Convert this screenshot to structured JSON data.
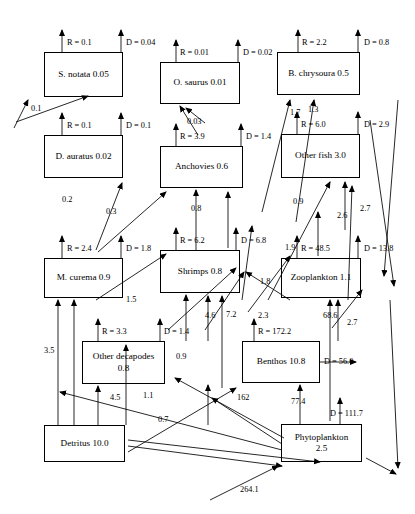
{
  "figure": {
    "type": "ecological-flow-network-diagram",
    "width": 415,
    "height": 514,
    "background": "#ffffff",
    "line_color": "#000000"
  },
  "nodes": [
    {
      "id": "s_notata",
      "label": "S. notata 0.05",
      "biomass": 0.05,
      "respiration": 0.1,
      "detritus_export": 0.04,
      "x": 44,
      "y": 52,
      "w": 79,
      "h": 45
    },
    {
      "id": "o_saurus",
      "label": "O. saurus 0.01",
      "biomass": 0.01,
      "respiration": 0.01,
      "detritus_export": 0.02,
      "x": 160,
      "y": 62,
      "w": 80,
      "h": 42
    },
    {
      "id": "b_chrysoura",
      "label": "B. chrysoura 0.5",
      "biomass": 0.5,
      "respiration": 2.2,
      "detritus_export": 0.8,
      "x": 277,
      "y": 52,
      "w": 83,
      "h": 43
    },
    {
      "id": "d_auratus",
      "label": "D. auratus 0.02",
      "biomass": 0.02,
      "respiration": 0.1,
      "detritus_export": 0.1,
      "x": 44,
      "y": 135,
      "w": 79,
      "h": 43
    },
    {
      "id": "anchovies",
      "label": "Anchovies 0.6",
      "biomass": 0.6,
      "respiration": 3.9,
      "detritus_export": 1.4,
      "x": 160,
      "y": 146,
      "w": 83,
      "h": 42
    },
    {
      "id": "other_fish",
      "label": "Other fish 3.0",
      "biomass": 3.0,
      "respiration": 6.0,
      "detritus_export": 2.9,
      "x": 281,
      "y": 134,
      "w": 79,
      "h": 44
    },
    {
      "id": "m_curema",
      "label": "M. curema 0.9",
      "biomass": 0.9,
      "respiration": 2.4,
      "detritus_export": 1.8,
      "x": 44,
      "y": 258,
      "w": 79,
      "h": 40
    },
    {
      "id": "shrimps",
      "label": "Shrimps 0.8",
      "biomass": 0.8,
      "respiration": 6.2,
      "detritus_export": 6.8,
      "x": 160,
      "y": 250,
      "w": 80,
      "h": 43
    },
    {
      "id": "zooplankton",
      "label": "Zooplankton 1.1",
      "biomass": 1.1,
      "respiration": 48.5,
      "detritus_export": 13.8,
      "x": 281,
      "y": 258,
      "w": 80,
      "h": 40
    },
    {
      "id": "other_decapodes",
      "label": "Other decapodes\n0.8",
      "biomass": 0.8,
      "respiration": 3.3,
      "detritus_export": 1.4,
      "x": 82,
      "y": 341,
      "w": 83,
      "h": 43
    },
    {
      "id": "benthos",
      "label": "Benthos 10.8",
      "biomass": 10.8,
      "respiration": 172.2,
      "detritus_export": 56.0,
      "x": 242,
      "y": 341,
      "w": 78,
      "h": 42
    },
    {
      "id": "detritus",
      "label": "Detritus 10.0",
      "biomass": 10.0,
      "respiration": null,
      "detritus_export": null,
      "x": 44,
      "y": 425,
      "w": 81,
      "h": 37
    },
    {
      "id": "phytoplankton",
      "label": "Phytoplankton\n2.5",
      "biomass": 2.5,
      "respiration": null,
      "detritus_export": 111.7,
      "x": 281,
      "y": 424,
      "w": 81,
      "h": 38
    }
  ],
  "respiration_labels": [
    {
      "node": "s_notata",
      "text": "R = 0.1",
      "x": 67,
      "y": 38
    },
    {
      "node": "o_saurus",
      "text": "R = 0.01",
      "x": 180,
      "y": 48
    },
    {
      "node": "b_chrysoura",
      "text": "R = 2.2",
      "x": 302,
      "y": 38
    },
    {
      "node": "d_auratus",
      "text": "R = 0.1",
      "x": 67,
      "y": 121
    },
    {
      "node": "anchovies",
      "text": "R = 3.9",
      "x": 180,
      "y": 132
    },
    {
      "node": "other_fish",
      "text": "R = 6.0",
      "x": 301,
      "y": 120
    },
    {
      "node": "m_curema",
      "text": "R = 2.4",
      "x": 67,
      "y": 244
    },
    {
      "node": "shrimps",
      "text": "R = 6.2",
      "x": 180,
      "y": 236
    },
    {
      "node": "zooplankton",
      "text": "R = 48.5",
      "x": 301,
      "y": 244
    },
    {
      "node": "other_decapodes",
      "text": "R = 3.3",
      "x": 102,
      "y": 327
    },
    {
      "node": "benthos",
      "text": "R = 172.2",
      "x": 258,
      "y": 327
    }
  ],
  "detritus_export_labels": [
    {
      "node": "s_notata",
      "text": "D = 0.04",
      "x": 126,
      "y": 38
    },
    {
      "node": "o_saurus",
      "text": "D = 0.02",
      "x": 243,
      "y": 48
    },
    {
      "node": "b_chrysoura",
      "text": "D = 0.8",
      "x": 364,
      "y": 38
    },
    {
      "node": "d_auratus",
      "text": "D = 0.1",
      "x": 126,
      "y": 121
    },
    {
      "node": "anchovies",
      "text": "D = 1.4",
      "x": 246,
      "y": 132
    },
    {
      "node": "other_fish",
      "text": "D = 2.9",
      "x": 364,
      "y": 120
    },
    {
      "node": "m_curema",
      "text": "D = 1.8",
      "x": 126,
      "y": 244
    },
    {
      "node": "shrimps",
      "text": "D = 6.8",
      "x": 241,
      "y": 236
    },
    {
      "node": "zooplankton",
      "text": "D = 13.8",
      "x": 364,
      "y": 244
    },
    {
      "node": "other_decapodes",
      "text": "D = 1.4",
      "x": 164,
      "y": 327
    },
    {
      "node": "benthos",
      "text": "D = 56.0",
      "x": 324,
      "y": 357
    },
    {
      "node": "phytoplankton",
      "text": "D = 111.7",
      "x": 330,
      "y": 409
    }
  ],
  "flow_labels": [
    {
      "value": "0.1",
      "x": 31,
      "y": 104
    },
    {
      "value": "0.03",
      "x": 187,
      "y": 117
    },
    {
      "value": "1.7",
      "x": 290,
      "y": 108
    },
    {
      "value": "1.3",
      "x": 308,
      "y": 105
    },
    {
      "value": "0.2",
      "x": 62,
      "y": 195
    },
    {
      "value": "0.3",
      "x": 106,
      "y": 207
    },
    {
      "value": "0.8",
      "x": 191,
      "y": 204
    },
    {
      "value": "0.9",
      "x": 293,
      "y": 197
    },
    {
      "value": "2.6",
      "x": 337,
      "y": 211
    },
    {
      "value": "2.7",
      "x": 360,
      "y": 204
    },
    {
      "value": "1.9",
      "x": 285,
      "y": 243
    },
    {
      "value": "1.8",
      "x": 260,
      "y": 277
    },
    {
      "value": "1.5",
      "x": 126,
      "y": 295
    },
    {
      "value": "2.3",
      "x": 258,
      "y": 311
    },
    {
      "value": "4.6",
      "x": 205,
      "y": 311
    },
    {
      "value": "7.2",
      "x": 226,
      "y": 310
    },
    {
      "value": "68.6",
      "x": 323,
      "y": 311
    },
    {
      "value": "2.7",
      "x": 347,
      "y": 318
    },
    {
      "value": "3.5",
      "x": 44,
      "y": 346
    },
    {
      "value": "0.9",
      "x": 176,
      "y": 352
    },
    {
      "value": "4.5",
      "x": 110,
      "y": 393
    },
    {
      "value": "1.1",
      "x": 143,
      "y": 391
    },
    {
      "value": "162",
      "x": 237,
      "y": 393
    },
    {
      "value": "77.4",
      "x": 291,
      "y": 397
    },
    {
      "value": "0.7",
      "x": 158,
      "y": 415
    },
    {
      "value": "264.1",
      "x": 240,
      "y": 485
    }
  ]
}
